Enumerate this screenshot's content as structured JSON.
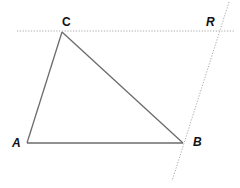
{
  "diagram": {
    "type": "geometry",
    "points": {
      "A": {
        "label": "A",
        "x": 27,
        "y": 143
      },
      "B": {
        "label": "B",
        "x": 183,
        "y": 143
      },
      "C": {
        "label": "C",
        "x": 62,
        "y": 32
      },
      "R": {
        "label": "R"
      }
    },
    "triangle": [
      "A",
      "B",
      "C"
    ],
    "dotted_lines": [
      {
        "name": "line-through-C-parallel",
        "from": [
          17,
          31
        ],
        "to": [
          234,
          31
        ]
      },
      {
        "name": "line-through-B-and-R",
        "from": [
          229,
          2
        ],
        "to": [
          172,
          181
        ]
      }
    ],
    "colors": {
      "solid_line": "#6b6b6b",
      "dotted_line": "#a8a8a8",
      "label": "#111111"
    }
  }
}
